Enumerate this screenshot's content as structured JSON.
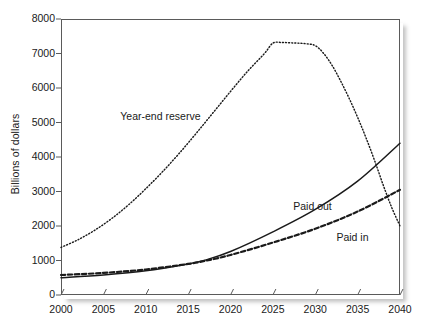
{
  "chart_data": {
    "type": "line",
    "title": "",
    "xlabel": "",
    "ylabel": "Billions of dollars",
    "xlim": [
      2000,
      2040
    ],
    "ylim": [
      0,
      8000
    ],
    "xticks": [
      2000,
      2005,
      2010,
      2015,
      2020,
      2025,
      2030,
      2035,
      2040
    ],
    "yticks": [
      0,
      1000,
      2000,
      3000,
      4000,
      5000,
      6000,
      7000,
      8000
    ],
    "xtick_labels": [
      "2000",
      "2005",
      "2010",
      "2015",
      "2020",
      "2025",
      "2030",
      "2035",
      "2040"
    ],
    "ytick_labels": [
      "0",
      "1000",
      "2000",
      "3000",
      "4000",
      "5000",
      "6000",
      "7000",
      "8000"
    ],
    "grid": false,
    "legend_position": "inline-annotations",
    "series": [
      {
        "name": "Year-end reserve",
        "style": "dotted",
        "color": "#1a1a1a",
        "x": [
          2000,
          2002,
          2004,
          2006,
          2008,
          2010,
          2012,
          2014,
          2016,
          2018,
          2020,
          2022,
          2024,
          2025,
          2026,
          2027,
          2028,
          2029,
          2030,
          2031,
          2032,
          2033,
          2034,
          2035,
          2036,
          2037,
          2038,
          2039,
          2040
        ],
        "values": [
          1380,
          1600,
          1880,
          2220,
          2620,
          3080,
          3580,
          4120,
          4700,
          5300,
          5900,
          6480,
          7000,
          7300,
          7320,
          7310,
          7300,
          7280,
          7230,
          7000,
          6650,
          6200,
          5700,
          5150,
          4550,
          3900,
          3200,
          2550,
          2000
        ]
      },
      {
        "name": "Paid out",
        "style": "solid",
        "color": "#1a1a1a",
        "x": [
          2000,
          2005,
          2010,
          2015,
          2017,
          2020,
          2025,
          2030,
          2035,
          2040
        ],
        "values": [
          500,
          580,
          700,
          900,
          1010,
          1260,
          1830,
          2480,
          3300,
          4400
        ]
      },
      {
        "name": "Paid in",
        "style": "dashed",
        "color": "#1a1a1a",
        "x": [
          2000,
          2005,
          2010,
          2015,
          2017,
          2020,
          2025,
          2030,
          2035,
          2040
        ],
        "values": [
          580,
          640,
          740,
          900,
          990,
          1160,
          1520,
          1920,
          2420,
          3050
        ]
      }
    ],
    "annotations": [
      {
        "text": "Year-end reserve",
        "x": 2007.0,
        "y": 5150
      },
      {
        "text": "Paid out",
        "x": 2027.4,
        "y": 2560
      },
      {
        "text": "Paid in",
        "x": 2032.5,
        "y": 1640
      }
    ]
  },
  "axis": {
    "y_title": "Billions of dollars"
  }
}
